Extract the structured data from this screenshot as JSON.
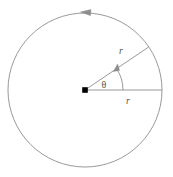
{
  "figure": {
    "background_color": "#ffffff",
    "width": 173,
    "height": 177,
    "stroke_color": "#8d8d8d",
    "center_dot_color": "#000000",
    "text_color": "#555555"
  },
  "geometry": {
    "center_x": 85,
    "center_y": 90,
    "radius": 77,
    "angle_degrees": 34,
    "rotation_direction": "counterclockwise"
  },
  "labels": {
    "radius_diagonal": "r",
    "radius_horizontal": "r",
    "angle": "θ"
  }
}
